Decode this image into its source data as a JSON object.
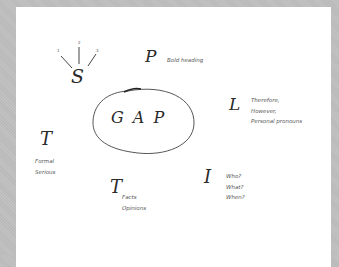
{
  "diagram": {
    "center": {
      "label": "G A P"
    },
    "nodes": [
      {
        "letter": "S",
        "labels": [
          "1",
          "2",
          "3"
        ]
      },
      {
        "letter": "P",
        "notes": [
          "Bold heading"
        ]
      },
      {
        "letter": "L",
        "notes": [
          "Therefore,",
          "However,",
          "Personal pronouns"
        ]
      },
      {
        "letter": "T",
        "notes": [
          "Formal",
          "Serious"
        ]
      },
      {
        "letter": "T",
        "notes": [
          "Facts",
          "Opinions"
        ]
      },
      {
        "letter": "I",
        "notes": [
          "Who?",
          "What?",
          "When?"
        ]
      }
    ]
  },
  "colors": {
    "background": "#bdbdbd",
    "paper": "#ffffff",
    "ink": "#2a2a2a"
  }
}
